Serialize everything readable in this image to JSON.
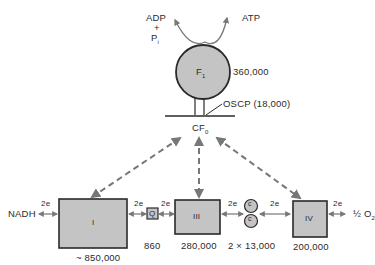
{
  "atp_synthase": {
    "f1_label": "F",
    "f1_sub": "1",
    "f1_mw": "360,000",
    "oscp_label": "OSCP (18,000)",
    "cf0_label": "CF",
    "cf0_sub": "0",
    "substrate_adp": "ADP",
    "substrate_plus": "+",
    "substrate_pi": "P",
    "substrate_pi_sub": "i",
    "product_atp": "ATP"
  },
  "chain": {
    "nadh_label": "NADH",
    "electron_label": "2e",
    "complex_i": {
      "label": "I",
      "mw": "~ 850,000"
    },
    "q": {
      "label": "Q",
      "mw": "860"
    },
    "complex_iii": {
      "label": "III",
      "mw": "280,000"
    },
    "cytochrome_c": {
      "label": "c",
      "mw": "2 × 13,000"
    },
    "complex_iv": {
      "label": "IV",
      "mw": "200,000"
    },
    "oxygen_label": "½ O",
    "oxygen_sub": "2"
  },
  "colors": {
    "fill": "#c4c4c4",
    "stroke": "#2a2a2a",
    "arrow": "#777777"
  }
}
